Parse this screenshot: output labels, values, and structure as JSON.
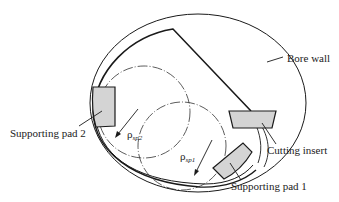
{
  "diagram": {
    "labels": {
      "bore_wall": "Bore wall",
      "supporting_pad_2": "Supporting pad 2",
      "supporting_pad_1": "Supporting pad 1",
      "cutting_insert": "Cutting insert",
      "rho_sp2_base": "ρ",
      "rho_sp2_sub": "sp2",
      "rho_sp1_base": "ρ",
      "rho_sp1_sub": "sp1"
    },
    "colors": {
      "line": "#1a1a1a",
      "pad_fill": "#d4d4d4",
      "background": "#ffffff"
    }
  }
}
